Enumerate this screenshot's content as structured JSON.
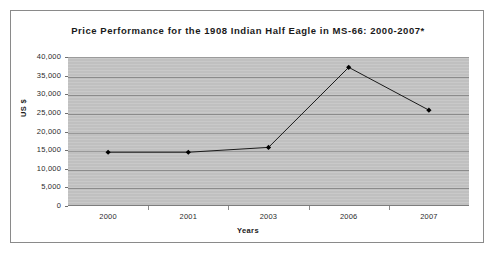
{
  "chart_data": {
    "type": "line",
    "title": "Price Performance for the 1908 Indian Half Eagle in MS-66: 2000-2007*",
    "xlabel": "Years",
    "ylabel": "US $",
    "categories": [
      "2000",
      "2001",
      "2003",
      "2006",
      "2007"
    ],
    "values": [
      14700,
      14700,
      16000,
      37500,
      26000
    ],
    "series": [
      {
        "name": "Price",
        "values": [
          14700,
          14700,
          16000,
          37500,
          26000
        ]
      }
    ],
    "ylim": [
      0,
      40000
    ],
    "y_ticks": [
      "40,000",
      "35,000",
      "30,000",
      "25,000",
      "20,000",
      "15,000",
      "10,000",
      "5,000",
      "0"
    ],
    "y_tick_values": [
      40000,
      35000,
      30000,
      25000,
      20000,
      15000,
      10000,
      5000,
      0
    ],
    "grid": "horizontal",
    "legend": "none",
    "plot_background": "#c3c3c3",
    "line_color": "#1a1a1a",
    "marker_color": "#000000",
    "marker_shape": "diamond"
  }
}
